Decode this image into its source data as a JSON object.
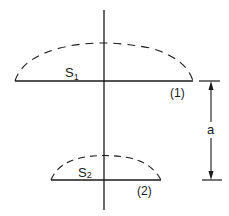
{
  "diagram": {
    "surfaces": [
      {
        "id": "1",
        "symbol": "S",
        "subscript": "1",
        "tag": "(1)"
      },
      {
        "id": "2",
        "symbol": "S",
        "subscript": "2",
        "tag": "(2)"
      }
    ],
    "dimension": {
      "label": "a"
    },
    "colors": {
      "stroke": "#1a1a1a",
      "background": "#ffffff"
    }
  }
}
